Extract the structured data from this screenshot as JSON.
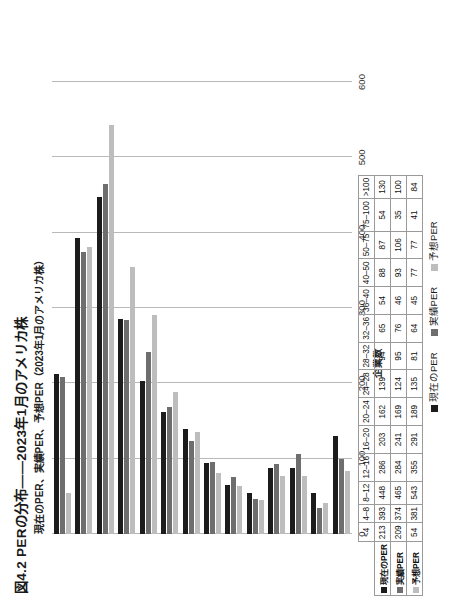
{
  "figure": {
    "title": "図4.2  PERの分布——2023年1月のアメリカ株",
    "subtitle": "現在のPER、実績PER、予想PER（2023年1月のアメリカ株）"
  },
  "colors": {
    "series_current": "#1c1c1c",
    "series_trailing": "#6e6e6e",
    "series_forward": "#bdbdbd",
    "gridline": "#b9b9b9"
  },
  "legend": {
    "position": "bottom",
    "items": [
      {
        "label": "現在のPER",
        "color": "#1c1c1c"
      },
      {
        "label": "実績PER",
        "color": "#6e6e6e"
      },
      {
        "label": "予想PER",
        "color": "#bdbdbd"
      }
    ]
  },
  "chart_data": {
    "type": "bar",
    "title": "図4.2  PERの分布——2023年1月のアメリカ株",
    "subtitle": "現在のPER、実績PER、予想PER（2023年1月のアメリカ株）",
    "xlabel": "",
    "ylabel": "企業数",
    "ylim": [
      0,
      600
    ],
    "yticks": [
      0,
      100,
      200,
      300,
      400,
      500,
      600
    ],
    "grid": true,
    "orientation": "vertical",
    "categories": [
      "<4",
      "4–8",
      "8–12",
      "12–16",
      "16–20",
      "20–24",
      "24–28",
      "28–32",
      "32–36",
      "36–40",
      "40–50",
      "50–75",
      "75–100",
      ">100"
    ],
    "series": [
      {
        "name": "現在のPER",
        "color": "#1c1c1c",
        "values": [
          213,
          393,
          448,
          286,
          203,
          162,
          139,
          94,
          65,
          54,
          88,
          87,
          54,
          130
        ]
      },
      {
        "name": "実績PER",
        "color": "#6e6e6e",
        "values": [
          209,
          374,
          465,
          284,
          241,
          169,
          124,
          95,
          76,
          46,
          93,
          106,
          35,
          100
        ]
      },
      {
        "name": "予想PER",
        "color": "#bdbdbd",
        "values": [
          54,
          381,
          543,
          355,
          291,
          189,
          135,
          81,
          64,
          45,
          77,
          77,
          41,
          84
        ]
      }
    ]
  },
  "table": {
    "corner_label": "",
    "column_headers": [
      "<4",
      "4–8",
      "8–12",
      "12–16",
      "16–20",
      "20–24",
      "24–28",
      "28–32",
      "32–36",
      "36–40",
      "40–50",
      "50–75",
      "75–100",
      ">100"
    ],
    "rows": [
      {
        "label": "現在のPER",
        "color": "#1c1c1c",
        "values": [
          "213",
          "393",
          "448",
          "286",
          "203",
          "162",
          "139",
          "94",
          "65",
          "54",
          "88",
          "87",
          "54",
          "130"
        ]
      },
      {
        "label": "実績PER",
        "color": "#6e6e6e",
        "values": [
          "209",
          "374",
          "465",
          "284",
          "241",
          "169",
          "124",
          "95",
          "76",
          "46",
          "93",
          "106",
          "35",
          "100"
        ]
      },
      {
        "label": "予想PER",
        "color": "#bdbdbd",
        "values": [
          "54",
          "381",
          "543",
          "355",
          "291",
          "189",
          "135",
          "81",
          "64",
          "45",
          "77",
          "77",
          "41",
          "84"
        ]
      }
    ]
  },
  "axis": {
    "tick_labels": [
      "0",
      "100",
      "200",
      "300",
      "400",
      "500",
      "600"
    ],
    "axis_title": "企業数"
  }
}
